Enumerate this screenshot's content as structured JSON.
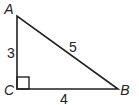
{
  "figure": {
    "type": "right-triangle",
    "vertices": {
      "A": {
        "label": "A"
      },
      "B": {
        "label": "B"
      },
      "C": {
        "label": "C",
        "right_angle": true
      }
    },
    "sides": {
      "AC": {
        "label": "3"
      },
      "AB": {
        "label": "5"
      },
      "CB": {
        "label": "4"
      }
    },
    "stroke_color": "#222222"
  }
}
